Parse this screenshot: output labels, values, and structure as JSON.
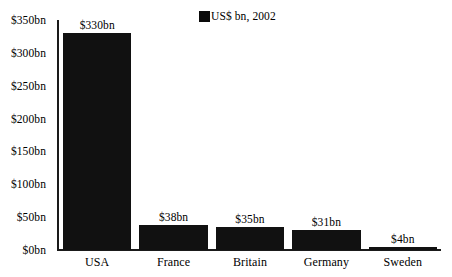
{
  "chart_data": {
    "type": "bar",
    "title": "",
    "subtitle": "",
    "xlabel": "",
    "ylabel": "",
    "categories": [
      "USA",
      "France",
      "Britain",
      "Germany",
      "Sweden"
    ],
    "values": [
      330,
      38,
      35,
      31,
      4
    ],
    "value_labels": [
      "$330bn",
      "$38bn",
      "$35bn",
      "$31bn",
      "$4bn"
    ],
    "ylim": [
      0,
      350
    ],
    "ytick_values": [
      0,
      50,
      100,
      150,
      200,
      250,
      300,
      350
    ],
    "ytick_labels": [
      "$0bn",
      "$50bn",
      "$100bn",
      "$150bn",
      "$200bn",
      "$250bn",
      "$300bn",
      "$350bn"
    ],
    "grid": false,
    "legend_position": "top-center",
    "series": [
      {
        "name": "US$ bn, 2002",
        "color": "#111111",
        "values": [
          330,
          38,
          35,
          31,
          4
        ]
      }
    ],
    "annotations": []
  },
  "legend": {
    "label": "US$ bn, 2002",
    "swatch_color": "#111111"
  },
  "colors": {
    "bar": "#111111",
    "axis": "#1a1a1a",
    "background": "#ffffff",
    "text": "#000000"
  }
}
